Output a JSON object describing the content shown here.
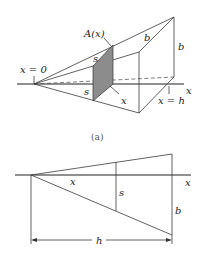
{
  "figure_a": {
    "caption": "(a)",
    "labels": {
      "area": "A(x)",
      "x_zero": "x = 0",
      "x_h": "x = h",
      "x_axis": "x",
      "s_top": "s",
      "s_left": "s",
      "x_depth": "x",
      "b_top": "b",
      "b_right": "b"
    },
    "shade_color": "#8c8c8c"
  },
  "figure_b": {
    "labels": {
      "x_axis": "x",
      "x_segment": "x",
      "s": "s",
      "b": "b",
      "h": "h"
    }
  }
}
